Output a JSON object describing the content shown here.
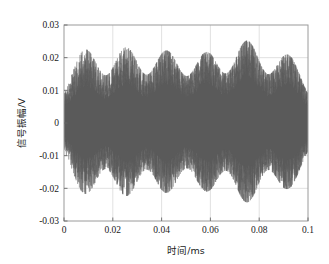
{
  "figure": {
    "background_color": "#ffffff",
    "plot_area": {
      "x": 64,
      "y": 25,
      "width": 244,
      "height": 196
    },
    "frame_color": "#9a9a9a",
    "grid_color": "#d9d9d9",
    "signal_color": "#5a5a5a"
  },
  "chart_data": {
    "type": "line",
    "title": "",
    "xlabel": "时间/ms",
    "ylabel": "信号振幅/V",
    "xlim": [
      0,
      0.1
    ],
    "ylim": [
      -0.03,
      0.03
    ],
    "xticks": [
      0,
      0.02,
      0.04,
      0.06,
      0.08,
      0.1
    ],
    "xtick_labels": [
      "0",
      "0.02",
      "0.04",
      "0.06",
      "0.08",
      "0.1"
    ],
    "yticks": [
      0.03,
      0.02,
      0.01,
      0,
      -0.01,
      -0.02,
      -0.03
    ],
    "ytick_labels": [
      "0.03",
      "0.02",
      "0.01",
      "0",
      "-0.01",
      "-0.02",
      "-0.03"
    ],
    "grid": true,
    "legend": null,
    "series": [
      {
        "name": "信号振幅",
        "color": "#5a5a5a",
        "envelope_period_ms": 0.0166,
        "burst_count": 6,
        "burst_centers_ms": [
          0.0088,
          0.0255,
          0.042,
          0.0585,
          0.075,
          0.0915
        ],
        "burst_peak_values": [
          0.02,
          0.0205,
          0.0196,
          0.0192,
          0.0223,
          0.0186
        ],
        "burst_trough_values": [
          -0.019,
          -0.0198,
          -0.0178,
          -0.0182,
          -0.0176,
          -0.0182
        ],
        "envelope_floor": 0.0042,
        "noise_rms": 0.0048,
        "carrier_frequency_khz": 1400,
        "sample_count": 2600
      }
    ]
  }
}
